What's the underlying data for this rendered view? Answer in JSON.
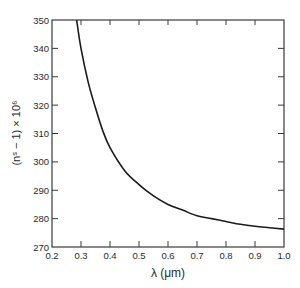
{
  "chart_data": {
    "type": "line",
    "title": "",
    "xlabel": "λ  (μm)",
    "ylabel": "(nˢ − 1) × 10⁶",
    "xlim": [
      0.2,
      1.0
    ],
    "ylim": [
      270,
      350
    ],
    "x_ticks": [
      0.2,
      0.3,
      0.4,
      0.5,
      0.6,
      0.7,
      0.8,
      0.9,
      1.0
    ],
    "x_tick_labels": [
      "0.2",
      "0.3",
      "0.4",
      "0.5",
      "0.6",
      "0.7",
      "0.8",
      "0.9",
      "1.0"
    ],
    "y_ticks": [
      270,
      280,
      290,
      300,
      310,
      320,
      330,
      340,
      350
    ],
    "y_tick_labels": [
      "270",
      "280",
      "290",
      "300",
      "310",
      "320",
      "330",
      "340",
      "350"
    ],
    "grid": false,
    "legend": null,
    "series": [
      {
        "name": "refractivity",
        "color": "#1a1a1a",
        "x": [
          0.285,
          0.3,
          0.325,
          0.35,
          0.375,
          0.4,
          0.45,
          0.5,
          0.55,
          0.6,
          0.65,
          0.7,
          0.75,
          0.8,
          0.85,
          0.9,
          0.95,
          1.0
        ],
        "values": [
          350,
          340,
          328,
          319,
          311,
          305,
          297,
          292,
          288,
          285,
          283,
          281,
          280,
          279,
          278,
          277.3,
          276.8,
          276.3
        ]
      }
    ]
  }
}
